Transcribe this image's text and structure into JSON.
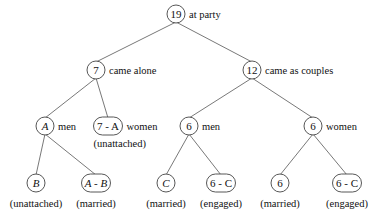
{
  "nodes": [
    {
      "id": "root",
      "label": "19",
      "italic": false,
      "x": 176,
      "y": 14,
      "shape": "circle",
      "w": 18,
      "side_label": "at party"
    },
    {
      "id": "alone",
      "label": "7",
      "italic": false,
      "x": 96,
      "y": 70,
      "shape": "circle",
      "w": 18,
      "side_label": "came alone"
    },
    {
      "id": "couples",
      "label": "12",
      "italic": false,
      "x": 252,
      "y": 70,
      "shape": "circle",
      "w": 18,
      "side_label": "came as couples"
    },
    {
      "id": "alone-men",
      "label": "A",
      "italic": true,
      "x": 45,
      "y": 126,
      "shape": "circle",
      "w": 18,
      "side_label": "men"
    },
    {
      "id": "alone-women",
      "label": "7 - A",
      "italic": false,
      "x": 108,
      "y": 126,
      "shape": "pill",
      "w": 27,
      "side_label": "women",
      "below_label": "(unattached)"
    },
    {
      "id": "couples-men",
      "label": "6",
      "italic": false,
      "x": 189,
      "y": 126,
      "shape": "circle",
      "w": 18,
      "side_label": "men"
    },
    {
      "id": "couples-women",
      "label": "6",
      "italic": false,
      "x": 313,
      "y": 126,
      "shape": "circle",
      "w": 18,
      "side_label": "women"
    },
    {
      "id": "men-unattached",
      "label": "B",
      "italic": true,
      "x": 36,
      "y": 183,
      "shape": "circle",
      "w": 18,
      "below_label": "(unattached)"
    },
    {
      "id": "men-married",
      "label": "A - B",
      "italic": true,
      "x": 96,
      "y": 183,
      "shape": "pill",
      "w": 27,
      "below_label": "(married)"
    },
    {
      "id": "cm-married",
      "label": "C",
      "italic": true,
      "x": 166,
      "y": 183,
      "shape": "circle",
      "w": 18,
      "below_label": "(married)"
    },
    {
      "id": "cm-engaged",
      "label": "6 - C",
      "italic": false,
      "x": 221,
      "y": 183,
      "shape": "pill",
      "w": 27,
      "below_label": "(engaged)"
    },
    {
      "id": "cw-married",
      "label": "6",
      "italic": false,
      "x": 280,
      "y": 183,
      "shape": "circle",
      "w": 18,
      "below_label": "(married)"
    },
    {
      "id": "cw-engaged",
      "label": "6 - C",
      "italic": false,
      "x": 347,
      "y": 183,
      "shape": "pill",
      "w": 27,
      "below_label": "(engaged)"
    }
  ],
  "edges": [
    [
      "root",
      "alone"
    ],
    [
      "root",
      "couples"
    ],
    [
      "alone",
      "alone-men"
    ],
    [
      "alone",
      "alone-women"
    ],
    [
      "couples",
      "couples-men"
    ],
    [
      "couples",
      "couples-women"
    ],
    [
      "alone-men",
      "men-unattached"
    ],
    [
      "alone-men",
      "men-married"
    ],
    [
      "couples-men",
      "cm-married"
    ],
    [
      "couples-men",
      "cm-engaged"
    ],
    [
      "couples-women",
      "cw-married"
    ],
    [
      "couples-women",
      "cw-engaged"
    ]
  ],
  "colors": {
    "edge": "#555555",
    "node_border": "#444444",
    "text": "#111111",
    "background": "#ffffff"
  }
}
